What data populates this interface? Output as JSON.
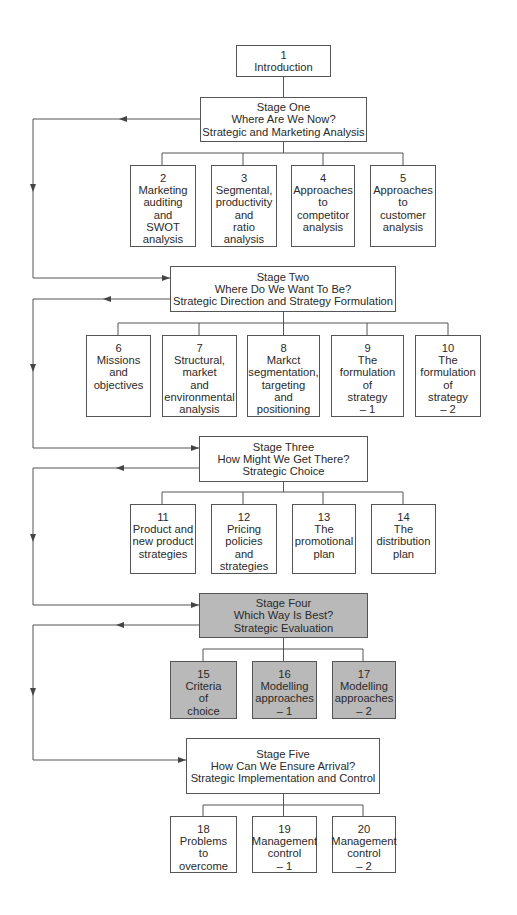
{
  "colors": {
    "line": "#555555",
    "box_fill": "#ffffff",
    "shaded_fill": "#b9b9b9",
    "text": "#2a2a2a"
  },
  "intro": {
    "number": "1",
    "title": "Introduction"
  },
  "stages": [
    {
      "label": "Stage One",
      "question": "Where Are We Now?",
      "subtitle": "Strategic and Marketing Analysis",
      "shaded": false,
      "chapters": [
        {
          "number": "2",
          "lines": [
            "Marketing",
            "auditing",
            "and",
            "SWOT",
            "analysis"
          ]
        },
        {
          "number": "3",
          "lines": [
            "Segmental,",
            "productivity",
            "and",
            "ratio",
            "analysis"
          ]
        },
        {
          "number": "4",
          "lines": [
            "Approaches",
            "to",
            "competitor",
            "analysis"
          ]
        },
        {
          "number": "5",
          "lines": [
            "Approaches",
            "to",
            "customer",
            "analysis"
          ]
        }
      ]
    },
    {
      "label": "Stage Two",
      "question": "Where Do We Want To Be?",
      "subtitle": "Strategic Direction and Strategy Formulation",
      "shaded": false,
      "chapters": [
        {
          "number": "6",
          "lines": [
            "Missions",
            "and",
            "objectives"
          ]
        },
        {
          "number": "7",
          "lines": [
            "Structural,",
            "market",
            "and",
            "environmental",
            "analysis"
          ]
        },
        {
          "number": "8",
          "lines": [
            "Markct",
            "segmentation,",
            "targeting",
            "and",
            "positioning"
          ]
        },
        {
          "number": "9",
          "lines": [
            "The",
            "formulation",
            "of",
            "strategy",
            "– 1"
          ]
        },
        {
          "number": "10",
          "lines": [
            "The",
            "formulation",
            "of",
            "strategy",
            "– 2"
          ]
        }
      ]
    },
    {
      "label": "Stage Three",
      "question": "How Might We Get There?",
      "subtitle": "Strategic Choice",
      "shaded": false,
      "chapters": [
        {
          "number": "11",
          "lines": [
            "Product and",
            "new product",
            "strategies"
          ]
        },
        {
          "number": "12",
          "lines": [
            "Pricing",
            "policies",
            "and",
            "strategies"
          ]
        },
        {
          "number": "13",
          "lines": [
            "The",
            "promotional",
            "plan"
          ]
        },
        {
          "number": "14",
          "lines": [
            "The",
            "distribution",
            "plan"
          ]
        }
      ]
    },
    {
      "label": "Stage Four",
      "question": "Which Way Is Best?",
      "subtitle": "Strategic Evaluation",
      "shaded": true,
      "chapters": [
        {
          "number": "15",
          "lines": [
            "Criteria",
            "of",
            "choice"
          ]
        },
        {
          "number": "16",
          "lines": [
            "Modelling",
            "approaches",
            "– 1"
          ]
        },
        {
          "number": "17",
          "lines": [
            "Modelling",
            "approaches",
            "– 2"
          ]
        }
      ]
    },
    {
      "label": "Stage Five",
      "question": "How Can We Ensure Arrival?",
      "subtitle": "Strategic Implementation and Control",
      "shaded": false,
      "chapters": [
        {
          "number": "18",
          "lines": [
            "Problems",
            "to",
            "overcome"
          ]
        },
        {
          "number": "19",
          "lines": [
            "Management",
            "control",
            "– 1"
          ]
        },
        {
          "number": "20",
          "lines": [
            "Management",
            "control",
            "– 2"
          ]
        }
      ]
    }
  ]
}
